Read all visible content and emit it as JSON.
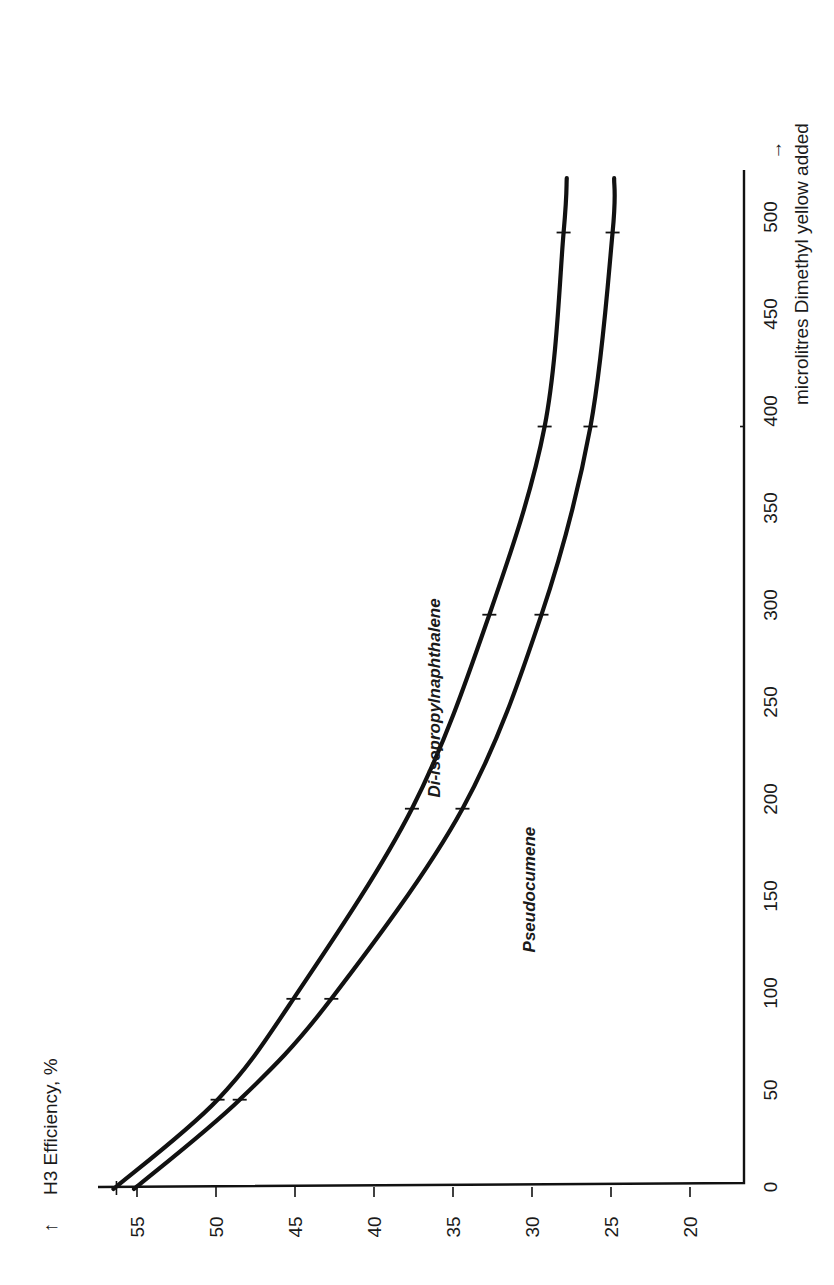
{
  "chart_data": {
    "type": "line",
    "orientation": "rotated-90-ccw",
    "title": "",
    "xlabel": "microlitres Dimethyl yellow added",
    "xlabel_arrow": "→",
    "ylabel": "H3 Efficiency, %",
    "ylabel_arrow": "↑",
    "x_ticks": [
      0,
      50,
      100,
      150,
      200,
      250,
      300,
      350,
      400,
      450,
      500
    ],
    "y_ticks": [
      55,
      50,
      45,
      40,
      35,
      30,
      25,
      20
    ],
    "xlim": [
      0,
      520
    ],
    "ylim": [
      16.7,
      57
    ],
    "grid": false,
    "legend": "inline labels",
    "series": [
      {
        "name": "Di-isopropylnaphthalene",
        "x": [
          0,
          45,
          97,
          195,
          295,
          392,
          492
        ],
        "y": [
          56.3,
          49.9,
          45.1,
          37.6,
          32.7,
          29.2,
          28.0
        ],
        "curve_end_x": 520,
        "curve_end_y": 27.8,
        "label_pos": {
          "x": 260,
          "y": 36.2
        }
      },
      {
        "name": "Pseudocumene",
        "x": [
          0,
          45,
          97,
          195,
          295,
          392,
          492
        ],
        "y": [
          55.0,
          48.5,
          42.7,
          34.4,
          29.4,
          26.3,
          24.9
        ],
        "curve_end_x": 520,
        "curve_end_y": 24.8,
        "label_pos": {
          "x": 157,
          "y": 30.2
        }
      }
    ]
  },
  "layout": {
    "x_origin_px": 1187,
    "x_px_per_unit": 1.94,
    "y_ref_value": 55,
    "y_ref_px": 137,
    "y_px_per_unit": 15.8,
    "axis_left_px": 98,
    "axis_right_px": 744,
    "axis_top_px": 170,
    "ink_color": "#111111"
  }
}
